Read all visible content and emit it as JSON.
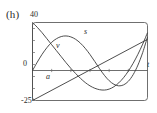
{
  "figure": {
    "panel_label": "(h)",
    "background_color": "#ffffff",
    "ink_color": "#2b2b2b"
  },
  "chart_data": {
    "type": "line",
    "title": "(h)",
    "xlabel": "t",
    "ylabel": "",
    "ylim": [
      -25,
      40
    ],
    "xlim": [
      0,
      12
    ],
    "grid": false,
    "legend": "inline-curve-labels",
    "y_tick_labels": [
      "40",
      "0",
      "-25"
    ],
    "y_tick_values": [
      40,
      0,
      -25
    ],
    "x_tick_labels": [],
    "frame": "box",
    "annotations": [
      {
        "text": "s",
        "x": 7.0,
        "y": 24.0,
        "italic": true
      },
      {
        "text": "v",
        "x": 3.1,
        "y": 16.0,
        "italic": true
      },
      {
        "text": "a",
        "x": 1.9,
        "y": -8.5,
        "italic": true
      },
      {
        "text": "t",
        "x": 12.4,
        "y": 0.0,
        "italic": true
      }
    ],
    "series": [
      {
        "name": "s",
        "label": "s",
        "description": "position curve: rises from zero to a maximum near t=4.5, falls below zero to a minimum near t=9, then rises steeply",
        "x": [
          0.0,
          0.5,
          1.0,
          1.5,
          2.0,
          2.5,
          3.0,
          3.5,
          4.0,
          4.5,
          5.0,
          5.5,
          6.0,
          6.5,
          7.0,
          7.5,
          8.0,
          8.5,
          9.0,
          9.5,
          10.0,
          10.5,
          11.0,
          11.5,
          12.0
        ],
        "y": [
          0.0,
          7.0,
          13.5,
          19.0,
          23.5,
          26.5,
          28.3,
          28.8,
          28.0,
          26.0,
          22.8,
          18.5,
          13.3,
          7.5,
          1.5,
          -4.0,
          -8.5,
          -11.5,
          -12.8,
          -12.0,
          -9.0,
          -3.5,
          4.5,
          15.0,
          28.0
        ]
      },
      {
        "name": "v",
        "label": "v",
        "description": "velocity curve: starts near the top at 40, decreases, crosses zero near t=3.7, reaches a minimum near t=8, then rises steeply crossing zero near t=10.6",
        "x": [
          0.0,
          0.5,
          1.0,
          1.5,
          2.0,
          2.5,
          3.0,
          3.5,
          4.0,
          4.5,
          5.0,
          5.5,
          6.0,
          6.5,
          7.0,
          7.5,
          8.0,
          8.5,
          9.0,
          9.5,
          10.0,
          10.5,
          11.0,
          11.5,
          12.0
        ],
        "y": [
          40.0,
          36.0,
          31.5,
          26.5,
          21.5,
          16.5,
          11.5,
          6.5,
          1.8,
          -2.5,
          -6.5,
          -10.0,
          -12.8,
          -14.8,
          -16.0,
          -16.3,
          -15.5,
          -13.5,
          -10.3,
          -6.0,
          -0.5,
          6.0,
          13.5,
          22.0,
          31.5
        ]
      },
      {
        "name": "a",
        "label": "a",
        "description": "acceleration: straight line increasing from -25 at t=0 to about 26 at t=12, crossing zero near t=5.9",
        "x": [
          0.0,
          12.0
        ],
        "y": [
          -25.0,
          26.0
        ]
      }
    ]
  }
}
